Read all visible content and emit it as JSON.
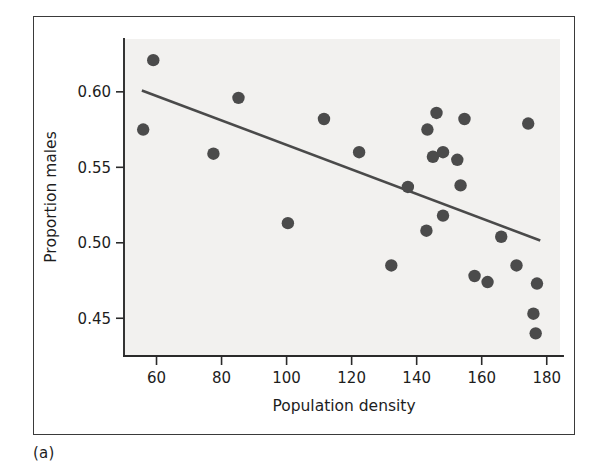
{
  "figure": {
    "panel_label": "(a)",
    "background_color": "#f2f1ef",
    "point_color": "#4b4b4b",
    "line_color": "#4a4a4a",
    "axis_color": "#2a2a2a"
  },
  "chart_data": {
    "type": "scatter",
    "title": "",
    "xlabel": "Population density",
    "ylabel": "Proportion males",
    "xlim": [
      50,
      185
    ],
    "ylim": [
      0.425,
      0.635
    ],
    "xticks": [
      60,
      80,
      100,
      120,
      140,
      160,
      180
    ],
    "yticks": [
      0.45,
      0.5,
      0.55,
      0.6
    ],
    "xtick_labels": [
      "60",
      "80",
      "100",
      "120",
      "140",
      "160",
      "180"
    ],
    "ytick_labels": [
      "0.45",
      "0.50",
      "0.55",
      "0.60"
    ],
    "grid": false,
    "legend": null,
    "points": [
      {
        "x": 59.0,
        "y": 0.621
      },
      {
        "x": 55.9,
        "y": 0.575
      },
      {
        "x": 77.5,
        "y": 0.559
      },
      {
        "x": 85.2,
        "y": 0.596
      },
      {
        "x": 100.4,
        "y": 0.513
      },
      {
        "x": 111.5,
        "y": 0.582
      },
      {
        "x": 122.3,
        "y": 0.56
      },
      {
        "x": 132.2,
        "y": 0.485
      },
      {
        "x": 137.3,
        "y": 0.537
      },
      {
        "x": 143.0,
        "y": 0.508
      },
      {
        "x": 143.3,
        "y": 0.575
      },
      {
        "x": 145.0,
        "y": 0.557
      },
      {
        "x": 146.1,
        "y": 0.586
      },
      {
        "x": 148.1,
        "y": 0.56
      },
      {
        "x": 148.1,
        "y": 0.518
      },
      {
        "x": 152.5,
        "y": 0.555
      },
      {
        "x": 153.5,
        "y": 0.538
      },
      {
        "x": 154.7,
        "y": 0.582
      },
      {
        "x": 157.8,
        "y": 0.478
      },
      {
        "x": 161.8,
        "y": 0.474
      },
      {
        "x": 166.0,
        "y": 0.504
      },
      {
        "x": 170.7,
        "y": 0.485
      },
      {
        "x": 174.3,
        "y": 0.579
      },
      {
        "x": 177.0,
        "y": 0.473
      },
      {
        "x": 175.9,
        "y": 0.453
      },
      {
        "x": 176.6,
        "y": 0.44
      }
    ],
    "fit_line": {
      "x_start": 55.5,
      "y_start": 0.6009,
      "x_end": 178.0,
      "y_end": 0.5015
    }
  }
}
